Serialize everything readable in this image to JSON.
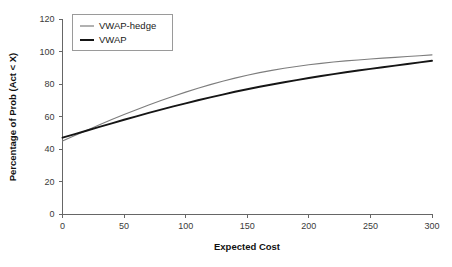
{
  "chart_data": {
    "type": "line",
    "title": "",
    "xlabel": "Expected Cost",
    "ylabel": "Percentage of Prob (Act < X)",
    "xlim": [
      0,
      300
    ],
    "ylim": [
      0,
      120
    ],
    "xticks": [
      0,
      50,
      100,
      150,
      200,
      250,
      300
    ],
    "yticks": [
      0,
      20,
      40,
      60,
      80,
      100,
      120
    ],
    "xtick_labels": [
      "0",
      "50",
      "100",
      "150",
      "200",
      "250",
      "300"
    ],
    "ytick_labels": [
      "0",
      "20",
      "40",
      "60",
      "80",
      "100",
      "120"
    ],
    "grid": false,
    "legend_position": "upper-left",
    "x": [
      0,
      10,
      20,
      30,
      40,
      50,
      60,
      70,
      80,
      90,
      100,
      110,
      120,
      130,
      140,
      150,
      160,
      170,
      180,
      190,
      200,
      210,
      220,
      230,
      240,
      250,
      260,
      270,
      280,
      290,
      300
    ],
    "series": [
      {
        "name": "VWAP-hedge",
        "color": "#7d7d7d",
        "width": 1.1,
        "values": [
          45.0,
          48.3,
          51.6,
          54.9,
          58.1,
          61.2,
          64.2,
          67.1,
          69.9,
          72.5,
          75.0,
          77.4,
          79.6,
          81.7,
          83.6,
          85.4,
          87.0,
          88.4,
          89.7,
          90.8,
          91.8,
          92.7,
          93.5,
          94.2,
          94.8,
          95.4,
          95.9,
          96.4,
          96.9,
          97.4,
          97.9
        ]
      },
      {
        "name": "VWAP",
        "color": "#151515",
        "width": 1.9,
        "values": [
          47.0,
          49.2,
          51.4,
          53.6,
          55.8,
          58.0,
          60.1,
          62.2,
          64.2,
          66.2,
          68.1,
          70.0,
          71.8,
          73.5,
          75.2,
          76.8,
          78.3,
          79.7,
          81.1,
          82.4,
          83.7,
          84.9,
          86.1,
          87.2,
          88.3,
          89.3,
          90.3,
          91.3,
          92.3,
          93.3,
          94.3
        ]
      }
    ]
  },
  "legend": {
    "entries": [
      {
        "label": "VWAP-hedge"
      },
      {
        "label": "VWAP"
      }
    ]
  },
  "axes": {
    "x_title": "Expected Cost",
    "y_title": "Percentage of Prob (Act < X)"
  }
}
